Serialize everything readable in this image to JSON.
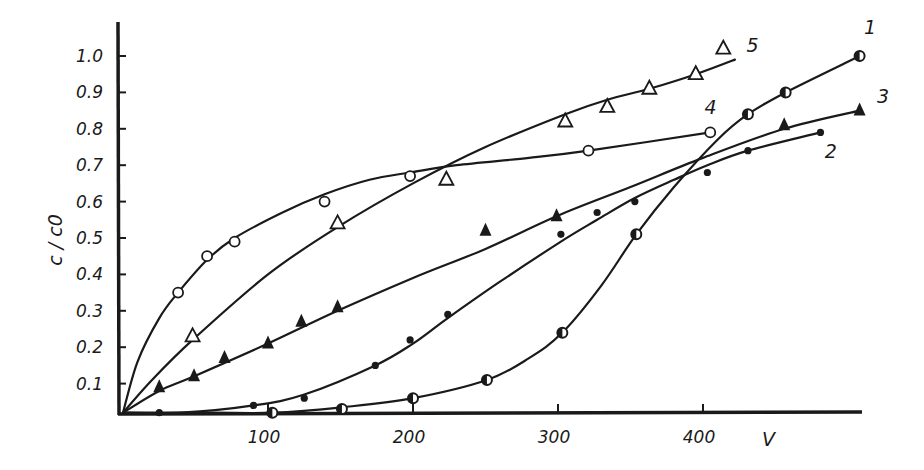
{
  "chart_data": {
    "type": "scatter",
    "title": "",
    "xlabel": "V",
    "ylabel": "c / c0",
    "xlim": [
      0,
      510
    ],
    "ylim": [
      0,
      1.08
    ],
    "grid": false,
    "legend": "inline curve numbers at line ends",
    "x_ticks": [
      100,
      200,
      300,
      400
    ],
    "x_tick_labels": [
      "100",
      "200",
      "300",
      "400"
    ],
    "y_ticks": [
      0.1,
      0.2,
      0.3,
      0.4,
      0.5,
      0.6,
      0.7,
      0.8,
      0.9,
      1.0
    ],
    "y_tick_labels": [
      "0.1",
      "0.2",
      "0.3",
      "0.4",
      "0.5",
      "0.6",
      "0.7",
      "0.8",
      "0.9",
      "1.0"
    ],
    "series": [
      {
        "name": "1",
        "marker": "half-filled-circle",
        "points": [
          [
            103,
            0.02
          ],
          [
            151,
            0.03
          ],
          [
            200,
            0.06
          ],
          [
            251,
            0.11
          ],
          [
            303,
            0.24
          ],
          [
            354,
            0.51
          ],
          [
            431,
            0.84
          ],
          [
            457,
            0.9
          ],
          [
            508,
            1.0
          ]
        ],
        "curve": [
          [
            0,
            0.02
          ],
          [
            60,
            0.02
          ],
          [
            103,
            0.02
          ],
          [
            151,
            0.035
          ],
          [
            200,
            0.06
          ],
          [
            251,
            0.11
          ],
          [
            280,
            0.17
          ],
          [
            303,
            0.24
          ],
          [
            330,
            0.37
          ],
          [
            354,
            0.51
          ],
          [
            380,
            0.64
          ],
          [
            410,
            0.77
          ],
          [
            431,
            0.84
          ],
          [
            457,
            0.9
          ],
          [
            508,
            1.0
          ]
        ],
        "label_pos": [
          511,
          1.06
        ]
      },
      {
        "name": "2",
        "marker": "filled-dot",
        "points": [
          [
            25,
            0.02
          ],
          [
            90,
            0.04
          ],
          [
            125,
            0.06
          ],
          [
            174,
            0.15
          ],
          [
            198,
            0.22
          ],
          [
            224,
            0.29
          ],
          [
            302,
            0.51
          ],
          [
            327,
            0.57
          ],
          [
            353,
            0.6
          ],
          [
            403,
            0.68
          ],
          [
            431,
            0.74
          ],
          [
            481,
            0.79
          ]
        ],
        "curve": [
          [
            0,
            0.02
          ],
          [
            40,
            0.02
          ],
          [
            90,
            0.04
          ],
          [
            125,
            0.07
          ],
          [
            174,
            0.15
          ],
          [
            200,
            0.21
          ],
          [
            224,
            0.28
          ],
          [
            260,
            0.38
          ],
          [
            302,
            0.49
          ],
          [
            327,
            0.55
          ],
          [
            353,
            0.61
          ],
          [
            380,
            0.66
          ],
          [
            403,
            0.7
          ],
          [
            431,
            0.74
          ],
          [
            481,
            0.79
          ]
        ],
        "label_pos": [
          484,
          0.72
        ]
      },
      {
        "name": "3",
        "marker": "filled-triangle",
        "points": [
          [
            25,
            0.09
          ],
          [
            49,
            0.12
          ],
          [
            70,
            0.17
          ],
          [
            100,
            0.21
          ],
          [
            123,
            0.27
          ],
          [
            148,
            0.31
          ],
          [
            250,
            0.52
          ],
          [
            299,
            0.56
          ],
          [
            456,
            0.81
          ],
          [
            508,
            0.85
          ]
        ],
        "curve": [
          [
            0,
            0.02
          ],
          [
            25,
            0.08
          ],
          [
            49,
            0.12
          ],
          [
            100,
            0.21
          ],
          [
            148,
            0.3
          ],
          [
            200,
            0.39
          ],
          [
            250,
            0.47
          ],
          [
            299,
            0.56
          ],
          [
            350,
            0.64
          ],
          [
            400,
            0.72
          ],
          [
            456,
            0.8
          ],
          [
            508,
            0.85
          ]
        ],
        "label_pos": [
          520,
          0.87
        ]
      },
      {
        "name": "4",
        "marker": "open-circle",
        "points": [
          [
            38,
            0.35
          ],
          [
            58,
            0.45
          ],
          [
            77,
            0.49
          ],
          [
            139,
            0.6
          ],
          [
            198,
            0.67
          ],
          [
            321,
            0.74
          ],
          [
            405,
            0.79
          ]
        ],
        "curve": [
          [
            0,
            0.02
          ],
          [
            10,
            0.16
          ],
          [
            25,
            0.28
          ],
          [
            38,
            0.35
          ],
          [
            58,
            0.44
          ],
          [
            77,
            0.5
          ],
          [
            110,
            0.57
          ],
          [
            139,
            0.62
          ],
          [
            170,
            0.66
          ],
          [
            198,
            0.68
          ],
          [
            230,
            0.7
          ],
          [
            280,
            0.72
          ],
          [
            321,
            0.74
          ],
          [
            405,
            0.79
          ]
        ],
        "label_pos": [
          401,
          0.84
        ]
      },
      {
        "name": "5",
        "marker": "open-triangle",
        "points": [
          [
            48,
            0.23
          ],
          [
            148,
            0.54
          ],
          [
            223,
            0.66
          ],
          [
            305,
            0.82
          ],
          [
            334,
            0.86
          ],
          [
            363,
            0.91
          ],
          [
            395,
            0.95
          ],
          [
            414,
            1.02
          ]
        ],
        "curve": [
          [
            0,
            0.02
          ],
          [
            20,
            0.11
          ],
          [
            48,
            0.22
          ],
          [
            100,
            0.4
          ],
          [
            148,
            0.53
          ],
          [
            200,
            0.65
          ],
          [
            250,
            0.75
          ],
          [
            305,
            0.84
          ],
          [
            334,
            0.88
          ],
          [
            363,
            0.91
          ],
          [
            395,
            0.95
          ],
          [
            422,
            0.99
          ]
        ],
        "label_pos": [
          430,
          1.01
        ]
      }
    ]
  }
}
